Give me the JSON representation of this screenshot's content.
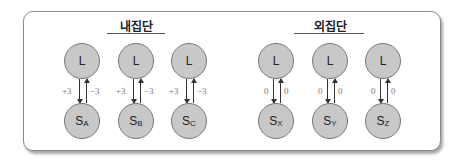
{
  "groups": [
    {
      "title": "내집단",
      "units": [
        {
          "top": "L",
          "bottom_main": "S",
          "bottom_sub": "A",
          "down_label": "+3",
          "up_label": "−3"
        },
        {
          "top": "L",
          "bottom_main": "S",
          "bottom_sub": "B",
          "down_label": "+3",
          "up_label": "−3"
        },
        {
          "top": "L",
          "bottom_main": "S",
          "bottom_sub": "C",
          "down_label": "+3",
          "up_label": "−3"
        }
      ]
    },
    {
      "title": "외집단",
      "units": [
        {
          "top": "L",
          "bottom_main": "S",
          "bottom_sub": "X",
          "down_label": "0",
          "up_label": "0"
        },
        {
          "top": "L",
          "bottom_main": "S",
          "bottom_sub": "Y",
          "down_label": "0",
          "up_label": "0"
        },
        {
          "top": "L",
          "bottom_main": "S",
          "bottom_sub": "Z",
          "down_label": "0",
          "up_label": "0"
        }
      ]
    }
  ],
  "colors": {
    "node_fill": "#c8c8c8",
    "node_border": "#777777",
    "arrow": "#333333",
    "label": "#777777",
    "panel_border": "#8a8a8a"
  }
}
